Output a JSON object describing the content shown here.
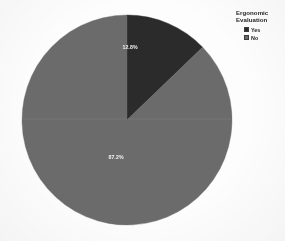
{
  "figure": {
    "background_color": "#fdfdfd",
    "pie": {
      "center_x": 127,
      "center_y": 120,
      "radius": 105,
      "start_angle_deg": 0
    }
  },
  "legend": {
    "title": "Ergonomic\nEvaluation",
    "title_line1": "Ergonomic",
    "title_line2": "Evaluation",
    "items": [
      {
        "label": "Yes",
        "color": "#2b2b2b"
      },
      {
        "label": "No",
        "color": "#6b6b6b"
      }
    ]
  },
  "chart_data": {
    "type": "pie",
    "title": "Ergonomic Evaluation",
    "xlabel": "",
    "ylabel": "",
    "categories": [
      "Yes",
      "No"
    ],
    "values": [
      12.8,
      87.2
    ],
    "value_labels": [
      "12.8%",
      "87.2%"
    ],
    "colors": [
      "#2b2b2b",
      "#6b6b6b"
    ],
    "units": "percent",
    "start_angle_deg": 90,
    "direction": "clockwise",
    "legend_position": "top-right",
    "grid": false,
    "slices": [
      {
        "name": "Yes",
        "value": 12.8,
        "label": "12.8%",
        "color": "#2b2b2b",
        "label_x": 130,
        "label_y": 48
      },
      {
        "name": "No",
        "value": 87.2,
        "label": "87.2%",
        "color": "#6b6b6b",
        "label_x": 116,
        "label_y": 158
      }
    ]
  }
}
